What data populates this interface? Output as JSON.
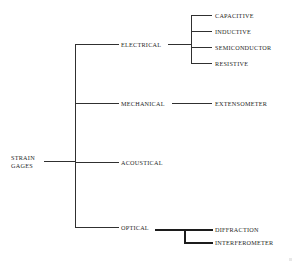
{
  "figure": {
    "type": "tree-diagram",
    "title_fragment": "STRAIN GAGES",
    "clipped_header_text": "",
    "background_color": "#ffffff",
    "line_color": "#303030",
    "bold_line_color": "#1c1c1c",
    "text_color": "#262626"
  },
  "tree": {
    "root": {
      "label_line1": "STRAIN",
      "label_line2": "GAGES",
      "label": "STRAIN GAGES"
    },
    "level1": [
      {
        "label": "ELECTRICAL"
      },
      {
        "label": "MECHANICAL"
      },
      {
        "label": "ACOUSTICAL"
      },
      {
        "label": "OPTICAL"
      }
    ],
    "electrical_children": [
      {
        "label": "CAPACITIVE"
      },
      {
        "label": "INDUCTIVE"
      },
      {
        "label": "SEMICONDUCTOR"
      },
      {
        "label": "RESISTIVE"
      }
    ],
    "mechanical_children": [
      {
        "label": "EXTENSOMETER"
      }
    ],
    "acoustical_children": [],
    "optical_children": [
      {
        "label": "DIFFRACTION"
      },
      {
        "label": "INTERFEROMETER"
      }
    ]
  }
}
